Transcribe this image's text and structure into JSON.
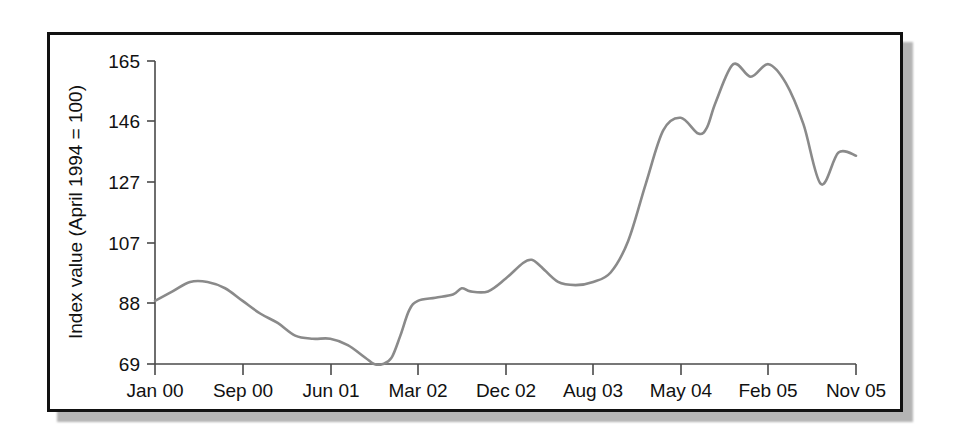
{
  "figure": {
    "frame_color": "#111111",
    "shadow_color": "#b4b4b4",
    "background": "#ffffff"
  },
  "chart_data": {
    "type": "line",
    "title": "",
    "subtitle": "",
    "xlabel": "",
    "ylabel": "Index value (April 1994 = 100)",
    "line_color": "#8a8a8a",
    "axis_color": "#4a4a4a",
    "grid": false,
    "legend": null,
    "legend_position": "none",
    "ylim": [
      69,
      165
    ],
    "ytick_labels": [
      "165",
      "146",
      "127",
      "107",
      "88",
      "69"
    ],
    "ytick_values": [
      165,
      146,
      127,
      107,
      88,
      69
    ],
    "xtick_labels": [
      "Jan 00",
      "Sep 00",
      "Jun 01",
      "Mar 02",
      "Dec 02",
      "Aug 03",
      "May 04",
      "Feb 05",
      "Nov 05"
    ],
    "xtick_values": [
      0,
      8,
      17,
      26,
      35,
      43,
      52,
      61,
      70
    ],
    "xlim": [
      0,
      70
    ],
    "series": [
      {
        "name": "Index value",
        "x": [
          0,
          2,
          4,
          6,
          8,
          10,
          12,
          14,
          16,
          18,
          20,
          22,
          24,
          25,
          26,
          27,
          28,
          29,
          30,
          32,
          34,
          35,
          36,
          38,
          40,
          42,
          43,
          44,
          46,
          48,
          50,
          52,
          54,
          56,
          58,
          60,
          62,
          63,
          64,
          66,
          68,
          70
        ],
        "values": [
          89,
          92,
          95,
          95,
          93,
          89,
          85,
          82,
          78,
          77,
          77,
          75,
          71,
          69,
          69,
          71,
          78,
          86,
          89,
          90,
          91,
          93,
          92,
          92,
          96,
          101,
          102,
          100,
          95,
          94,
          95,
          98,
          108,
          126,
          143,
          147,
          142,
          144,
          152,
          164,
          160,
          164
        ]
      }
    ],
    "series_tail": {
      "x": [
        70,
        72,
        74,
        76,
        78,
        80
      ],
      "values": [
        164,
        158,
        145,
        126,
        136,
        135
      ]
    }
  }
}
